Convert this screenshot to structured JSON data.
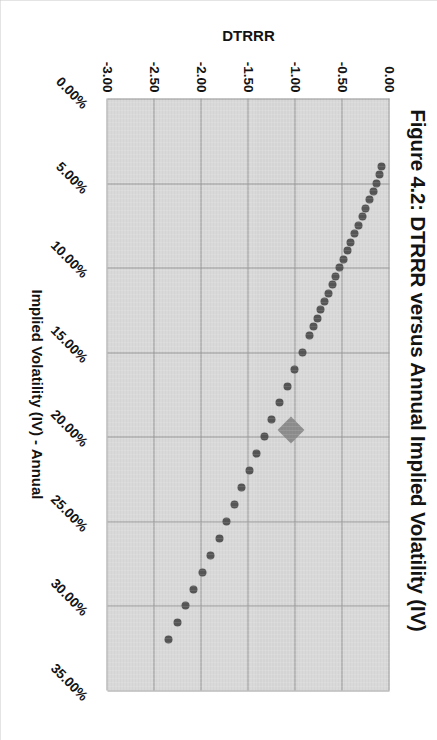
{
  "figure": {
    "title": "Figure 4.2: DTRRR versus Annual Implied Volatility (IV)"
  },
  "chart_data": {
    "type": "scatter",
    "title": "Figure 4.2: DTRRR versus Annual Implied Volatility (IV)",
    "xlabel": "Implied Volatility (IV) - Annual",
    "ylabel": "DTRRR",
    "xlim": [
      0,
      0.35
    ],
    "ylim": [
      -3.0,
      0.0
    ],
    "grid": true,
    "legend": false,
    "xticks": [
      "0.00%",
      "5.00%",
      "10.00%",
      "15.00%",
      "20.00%",
      "25.00%",
      "30.00%",
      "35.00%"
    ],
    "xtick_values": [
      0.0,
      0.05,
      0.1,
      0.15,
      0.2,
      0.25,
      0.3,
      0.35
    ],
    "yticks": [
      "0.00",
      "-0.50",
      "-1.00",
      "-1.50",
      "-2.00",
      "-2.50",
      "-3.00"
    ],
    "ytick_values": [
      0.0,
      -0.5,
      -1.0,
      -1.5,
      -2.0,
      -2.5,
      -3.0
    ],
    "series": [
      {
        "name": "DTRRR",
        "marker": "circle",
        "color": "#565656",
        "x": [
          0.04,
          0.045,
          0.05,
          0.055,
          0.06,
          0.065,
          0.07,
          0.075,
          0.08,
          0.085,
          0.09,
          0.095,
          0.1,
          0.105,
          0.11,
          0.115,
          0.12,
          0.125,
          0.13,
          0.135,
          0.14,
          0.15,
          0.16,
          0.17,
          0.18,
          0.19,
          0.2,
          0.21,
          0.22,
          0.23,
          0.24,
          0.25,
          0.26,
          0.27,
          0.28,
          0.29,
          0.3,
          0.31,
          0.32
        ],
        "y": [
          -0.08,
          -0.11,
          -0.14,
          -0.17,
          -0.21,
          -0.25,
          -0.29,
          -0.33,
          -0.37,
          -0.41,
          -0.45,
          -0.49,
          -0.53,
          -0.57,
          -0.61,
          -0.65,
          -0.69,
          -0.73,
          -0.77,
          -0.81,
          -0.85,
          -0.93,
          -1.01,
          -1.09,
          -1.17,
          -1.25,
          -1.33,
          -1.41,
          -1.49,
          -1.57,
          -1.65,
          -1.73,
          -1.81,
          -1.9,
          -1.99,
          -2.08,
          -2.17,
          -2.26,
          -2.35
        ]
      },
      {
        "name": "Highlighted point",
        "marker": "diamond",
        "color": "#8e8e8e",
        "x": [
          0.196
        ],
        "y": [
          -1.05
        ]
      }
    ]
  },
  "axes": {
    "x": {
      "title": "Implied Volatility (IV) - Annual",
      "labels": [
        "0.00%",
        "5.00%",
        "10.00%",
        "15.00%",
        "20.00%",
        "25.00%",
        "30.00%",
        "35.00%"
      ]
    },
    "y": {
      "title": "DTRRR",
      "labels": [
        "0.00",
        "-0.50",
        "-1.00",
        "-1.50",
        "-2.00",
        "-2.50",
        "-3.00"
      ]
    }
  }
}
